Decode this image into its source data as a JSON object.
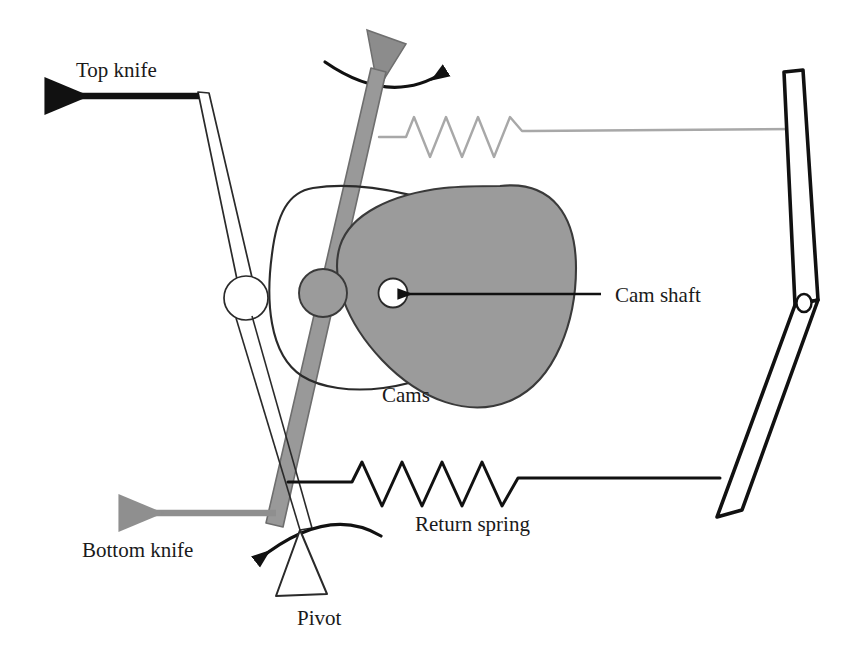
{
  "diagram": {
    "background_color": "#ffffff",
    "ink_color": "#111111",
    "gray_fill": "#9a9a9a",
    "light_gray": "#a9a9a9",
    "labels": {
      "top_knife": "Top knife",
      "bottom_knife": "Bottom knife",
      "cam_shaft": "Cam shaft",
      "cams": "Cams",
      "return_spring": "Return spring",
      "pivot": "Pivot"
    },
    "parts": [
      {
        "name": "top-knife-bar",
        "label": "Top knife",
        "style": "outline"
      },
      {
        "name": "top-knife-motion-arrow",
        "label": "Top knife",
        "style": "solid-black",
        "direction": "left"
      },
      {
        "name": "bottom-knife-bar",
        "label": "Bottom knife",
        "style": "gray-filled"
      },
      {
        "name": "bottom-knife-motion-arrow",
        "label": "Bottom knife",
        "style": "solid-gray",
        "direction": "left"
      },
      {
        "name": "cam-gray",
        "label": "Cams",
        "style": "gray-filled"
      },
      {
        "name": "cam-outline",
        "label": "Cams",
        "style": "outline"
      },
      {
        "name": "cam-shaft-hole",
        "label": "Cam shaft",
        "style": "white-circle"
      },
      {
        "name": "follower-roller",
        "label": "Follower roller",
        "style": "gray-circle"
      },
      {
        "name": "top-knife-pivot-circle",
        "label": "Top knife pivot",
        "style": "white-circle"
      },
      {
        "name": "rocker-lever",
        "label": "Rocker lever",
        "style": "outline"
      },
      {
        "name": "rocker-lever-hole",
        "label": "Lever pivot hole",
        "style": "white-circle"
      },
      {
        "name": "tension-spring-top",
        "label": "Top spring",
        "style": "light-gray-zigzag"
      },
      {
        "name": "return-spring-bottom",
        "label": "Return spring",
        "style": "black-zigzag"
      },
      {
        "name": "rotation-arrow-top",
        "label": "Rotation",
        "style": "curved-arrow",
        "direction": "clockwise"
      },
      {
        "name": "rotation-arrow-pivot",
        "label": "Pivot rotation",
        "style": "curved-arrow",
        "direction": "counter-clockwise"
      },
      {
        "name": "pivot-triangle",
        "label": "Pivot",
        "style": "outline-triangle"
      },
      {
        "name": "top-triangle-marker",
        "label": "Drive marker",
        "style": "gray-triangle"
      }
    ]
  }
}
